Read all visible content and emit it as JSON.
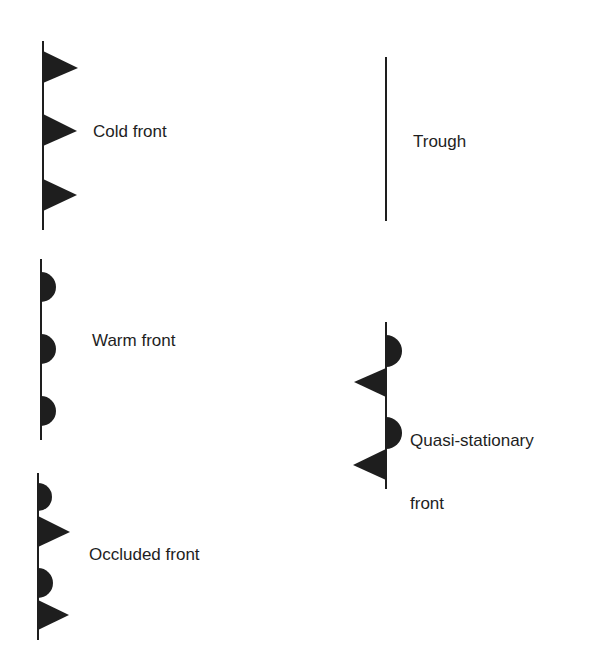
{
  "legend": {
    "cold_front": {
      "label": "Cold front",
      "symbol": "triangles-right",
      "line": {
        "x": 43,
        "y1": 41,
        "y2": 230
      },
      "shapes": [
        {
          "type": "triangle",
          "y_top": 51,
          "y_bottom": 83,
          "tip_x": 78
        },
        {
          "type": "triangle",
          "y_top": 114,
          "y_bottom": 146,
          "tip_x": 77
        },
        {
          "type": "triangle",
          "y_top": 179,
          "y_bottom": 211,
          "tip_x": 77
        }
      ]
    },
    "trough": {
      "label": "Trough",
      "symbol": "plain-line",
      "line": {
        "x": 386,
        "y1": 57,
        "y2": 221
      }
    },
    "warm_front": {
      "label": "Warm front",
      "symbol": "semicircles-right",
      "line": {
        "x": 41,
        "y1": 259,
        "y2": 440
      },
      "shapes": [
        {
          "type": "semicircle",
          "cy": 287,
          "r": 15,
          "side": "right"
        },
        {
          "type": "semicircle",
          "cy": 349,
          "r": 15,
          "side": "right"
        },
        {
          "type": "semicircle",
          "cy": 411,
          "r": 15,
          "side": "right"
        }
      ]
    },
    "quasi_stationary_front": {
      "label_line1": "Quasi-stationary",
      "label_line2": "front",
      "symbol": "alternating-semicircles-right-triangles-left",
      "line": {
        "x": 386,
        "y1": 322,
        "y2": 489
      },
      "shapes": [
        {
          "type": "semicircle",
          "cy": 351,
          "r": 16,
          "side": "right"
        },
        {
          "type": "triangle-left",
          "y_top": 368,
          "y_bottom": 397,
          "tip_x": 354
        },
        {
          "type": "semicircle",
          "cy": 433,
          "r": 16,
          "side": "right"
        },
        {
          "type": "triangle-left",
          "y_top": 449,
          "y_bottom": 480,
          "tip_x": 353
        }
      ]
    },
    "occluded_front": {
      "label": "Occluded front",
      "symbol": "alternating-semicircles-triangles-right",
      "line": {
        "x": 38,
        "y1": 473,
        "y2": 640
      },
      "shapes": [
        {
          "type": "semicircle",
          "cy": 497,
          "r": 14,
          "side": "right"
        },
        {
          "type": "triangle",
          "y_top": 516,
          "y_bottom": 547,
          "tip_x": 70
        },
        {
          "type": "semicircle",
          "cy": 583,
          "r": 15,
          "side": "right"
        },
        {
          "type": "triangle",
          "y_top": 600,
          "y_bottom": 630,
          "tip_x": 69
        }
      ]
    }
  },
  "colors": {
    "ink": "#1e1e1e",
    "background": "#ffffff"
  }
}
